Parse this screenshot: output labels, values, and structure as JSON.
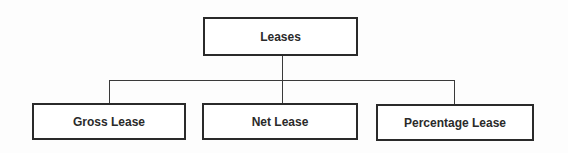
{
  "diagram": {
    "type": "hierarchy",
    "root": {
      "label": "Leases"
    },
    "children": [
      {
        "label": "Gross Lease"
      },
      {
        "label": "Net Lease"
      },
      {
        "label": "Percentage Lease"
      }
    ]
  }
}
